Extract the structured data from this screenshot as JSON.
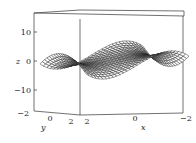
{
  "chart_data": {
    "type": "surface3d",
    "title": "",
    "xlabel": "x",
    "ylabel": "y",
    "zlabel": "z",
    "x_ticks": [
      "2",
      "0",
      "−2"
    ],
    "y_ticks": [
      "−2",
      "0",
      "2"
    ],
    "z_ticks": [
      "10",
      "0",
      "−10"
    ],
    "xlim": [
      -2,
      2
    ],
    "ylim": [
      -2,
      2
    ],
    "zlim": [
      -16,
      16
    ],
    "grid": false,
    "legend": null,
    "surface": {
      "description": "Wireframe mesh surface, saddle-like twisted sheet; z ranges roughly from -15 to 15",
      "mesh_resolution": [
        30,
        20
      ],
      "color": "#222222"
    }
  },
  "axes": {
    "z_label": "z",
    "y_label": "y",
    "x_label": "x",
    "z_tick_labels": [
      "10",
      "0",
      "−10"
    ],
    "y_tick_labels": [
      "−2",
      "0",
      "2"
    ],
    "x_tick_labels": [
      "2",
      "0",
      "−2"
    ]
  }
}
